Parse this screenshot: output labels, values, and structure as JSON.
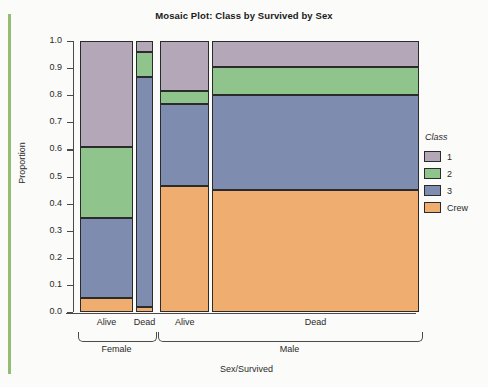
{
  "chart_data": {
    "type": "bar",
    "subtype": "mosaic",
    "title": "Mosaic Plot: Class by Survived by Sex",
    "xlabel": "Sex/Survived",
    "ylabel": "Proportion",
    "ylim": [
      0.0,
      1.0
    ],
    "grid": false,
    "legend_position": "right",
    "legend_title": "Class",
    "ytick_labels": [
      "1.0",
      "0.9",
      "0.8",
      "0.7",
      "0.6",
      "0.5",
      "0.4",
      "0.3",
      "0.2",
      "0.1",
      "0.0"
    ],
    "ytick_values": [
      1.0,
      0.9,
      0.8,
      0.7,
      0.6,
      0.5,
      0.4,
      0.3,
      0.2,
      0.1,
      0.0
    ],
    "categories": [
      "1",
      "2",
      "3",
      "Crew"
    ],
    "category_colors": [
      "#b3a7b8",
      "#8fc48c",
      "#7e8caf",
      "#f0ad70"
    ],
    "groups": [
      {
        "label": "Female",
        "columns": [
          {
            "label": "Alive",
            "width_fraction": 0.159,
            "values": [
              0.39,
              0.262,
              0.298,
              0.05
            ],
            "cum_boundaries": [
              1.0,
              0.61,
              0.348,
              0.05,
              0.0
            ]
          },
          {
            "label": "Dead",
            "width_fraction": 0.052,
            "values": [
              0.04,
              0.093,
              0.847,
              0.02
            ],
            "cum_boundaries": [
              1.0,
              0.96,
              0.867,
              0.02,
              0.0
            ]
          }
        ]
      },
      {
        "label": "Male",
        "columns": [
          {
            "label": "Alive",
            "width_fraction": 0.147,
            "values": [
              0.185,
              0.048,
              0.302,
              0.465
            ],
            "cum_boundaries": [
              1.0,
              0.815,
              0.767,
              0.465,
              0.0
            ]
          },
          {
            "label": "Dead",
            "width_fraction": 0.621,
            "values": [
              0.095,
              0.105,
              0.35,
              0.45
            ],
            "cum_boundaries": [
              1.0,
              0.905,
              0.8,
              0.45,
              0.0
            ]
          }
        ]
      }
    ],
    "legend_entries": [
      {
        "label": "1",
        "color": "#b3a7b8"
      },
      {
        "label": "2",
        "color": "#8fc48c"
      },
      {
        "label": "3",
        "color": "#7e8caf"
      },
      {
        "label": "Crew",
        "color": "#f0ad70"
      }
    ]
  }
}
